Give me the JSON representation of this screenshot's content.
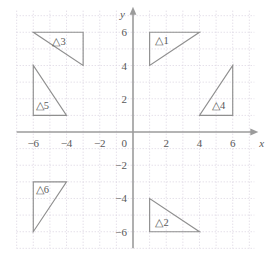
{
  "chart_data": {
    "type": "scatter",
    "title": "",
    "xlabel": "x",
    "ylabel": "y",
    "xlim": [
      -7,
      7.3
    ],
    "ylim": [
      -7,
      7.3
    ],
    "grid": true,
    "grid_step": 1,
    "legend": "none",
    "x_ticks": [
      {
        "value": -6,
        "label": "−6"
      },
      {
        "value": -4,
        "label": "−4"
      },
      {
        "value": -2,
        "label": "−2"
      },
      {
        "value": 2,
        "label": "2"
      },
      {
        "value": 4,
        "label": "4"
      },
      {
        "value": 6,
        "label": "6"
      }
    ],
    "y_ticks": [
      {
        "value": 6,
        "label": "6"
      },
      {
        "value": 4,
        "label": "4"
      },
      {
        "value": 2,
        "label": "2"
      },
      {
        "value": -2,
        "label": "−2"
      },
      {
        "value": -4,
        "label": "−4"
      },
      {
        "value": -6,
        "label": "−6"
      }
    ],
    "origin_label": "0",
    "shapes": [
      {
        "name": "triangle-1",
        "label": "△1",
        "vertices": [
          [
            1,
            4
          ],
          [
            1,
            6
          ],
          [
            4,
            6
          ]
        ],
        "label_pos": [
          1.35,
          5.45
        ]
      },
      {
        "name": "triangle-2",
        "label": "△2",
        "vertices": [
          [
            1,
            -4
          ],
          [
            1,
            -6
          ],
          [
            4,
            -6
          ]
        ],
        "label_pos": [
          1.35,
          -5.45
        ]
      },
      {
        "name": "triangle-3",
        "label": "△3",
        "vertices": [
          [
            -6,
            6
          ],
          [
            -3,
            6
          ],
          [
            -3,
            4
          ]
        ],
        "label_pos": [
          -4.85,
          5.4
        ]
      },
      {
        "name": "triangle-4",
        "label": "△4",
        "vertices": [
          [
            4,
            1
          ],
          [
            6,
            1
          ],
          [
            6,
            4
          ]
        ],
        "label_pos": [
          4.75,
          1.55
        ]
      },
      {
        "name": "triangle-5",
        "label": "△5",
        "vertices": [
          [
            -6,
            4
          ],
          [
            -6,
            1
          ],
          [
            -4,
            1
          ]
        ],
        "label_pos": [
          -5.85,
          1.55
        ]
      },
      {
        "name": "triangle-6",
        "label": "△6",
        "vertices": [
          [
            -6,
            -3
          ],
          [
            -4,
            -3
          ],
          [
            -6,
            -6
          ]
        ],
        "label_pos": [
          -5.85,
          -3.5
        ]
      }
    ],
    "colors": {
      "grid": "#d9d2e0",
      "axis": "#9b9b9b",
      "shape_stroke": "#8f8f8f",
      "text": "#585858",
      "background": "#ffffff"
    }
  }
}
